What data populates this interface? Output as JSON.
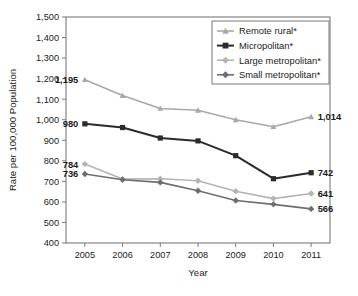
{
  "chart_data": {
    "type": "line",
    "title": "",
    "xlabel": "Year",
    "ylabel": "Rate per 100,000 Population",
    "categories": [
      "2005",
      "2006",
      "2007",
      "2008",
      "2009",
      "2010",
      "2011"
    ],
    "x": [
      2005,
      2006,
      2007,
      2008,
      2009,
      2010,
      2011
    ],
    "ylim": [
      400,
      1500
    ],
    "ytick_labels": [
      "1,500",
      "1,400",
      "1,300",
      "1,200",
      "1,100",
      "1,000",
      "900",
      "800",
      "700",
      "600",
      "500",
      "400"
    ],
    "ytick_values": [
      1500,
      1400,
      1300,
      1200,
      1100,
      1000,
      900,
      800,
      700,
      600,
      500,
      400
    ],
    "grid": false,
    "legend_position": "top-right",
    "series": [
      {
        "name": "Remote rural*",
        "marker": "triangle",
        "color": "#a8a8a8",
        "values": [
          1195,
          1118,
          1055,
          1046,
          1000,
          966,
          1014
        ],
        "start_label": "1,195",
        "end_label": "1,014"
      },
      {
        "name": "Micropolitan*",
        "marker": "square",
        "color": "#2b2b2b",
        "values": [
          980,
          962,
          911,
          897,
          825,
          713,
          742
        ],
        "start_label": "980",
        "end_label": "742"
      },
      {
        "name": "Large metropolitan*",
        "marker": "diamond",
        "color": "#b4b4b4",
        "values": [
          784,
          711,
          713,
          703,
          652,
          616,
          641
        ],
        "start_label": "784",
        "end_label": "641"
      },
      {
        "name": "Small metropolitan*",
        "marker": "diamond",
        "color": "#6e6e6e",
        "values": [
          736,
          708,
          695,
          654,
          607,
          588,
          566
        ],
        "start_label": "736",
        "end_label": "566"
      }
    ]
  },
  "legend": {
    "items": [
      {
        "label": "Remote rural*"
      },
      {
        "label": "Micropolitan*"
      },
      {
        "label": "Large metropolitan*"
      },
      {
        "label": "Small metropolitan*"
      }
    ]
  },
  "colors": {
    "frame": "#7a7a7a",
    "text": "#1b1b1b",
    "background": "#ffffff"
  }
}
